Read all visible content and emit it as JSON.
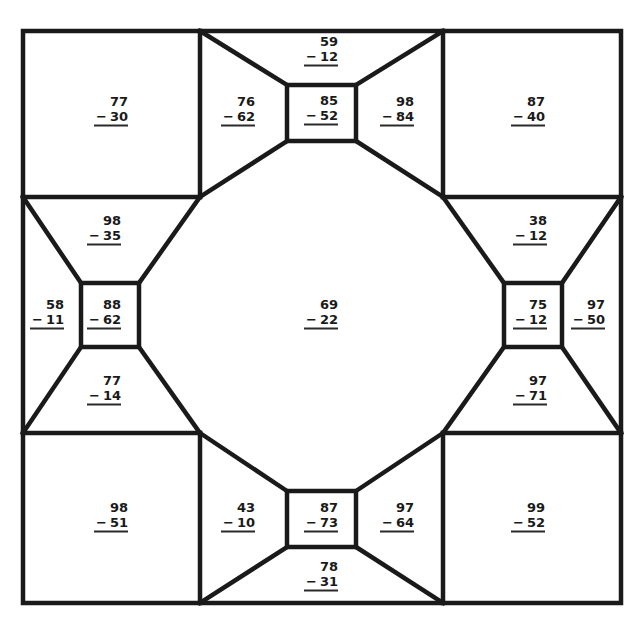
{
  "worksheet": {
    "type": "subtraction color-by-region puzzle",
    "operator": "−",
    "line_color": "#1a1a1a",
    "background_color": "#ffffff",
    "problems": [
      {
        "id": "corner-top-left",
        "minuend": "77",
        "subtrahend": "30",
        "x": 111,
        "y": 110
      },
      {
        "id": "top-left-trapezoid",
        "minuend": "76",
        "subtrahend": "62",
        "x": 238,
        "y": 110
      },
      {
        "id": "top-trapezoid",
        "minuend": "59",
        "subtrahend": "12",
        "x": 321,
        "y": 50
      },
      {
        "id": "top-center-box",
        "minuend": "85",
        "subtrahend": "52",
        "x": 321,
        "y": 109
      },
      {
        "id": "top-right-trapezoid",
        "minuend": "98",
        "subtrahend": "84",
        "x": 397,
        "y": 110
      },
      {
        "id": "corner-top-right",
        "minuend": "87",
        "subtrahend": "40",
        "x": 528,
        "y": 110
      },
      {
        "id": "left-top-trapezoid",
        "minuend": "98",
        "subtrahend": "35",
        "x": 104,
        "y": 229
      },
      {
        "id": "left-outer-trapezoid",
        "minuend": "58",
        "subtrahend": "11",
        "x": 47,
        "y": 313
      },
      {
        "id": "left-center-box",
        "minuend": "88",
        "subtrahend": "62",
        "x": 104,
        "y": 313
      },
      {
        "id": "left-bottom-trapezoid",
        "minuend": "77",
        "subtrahend": "14",
        "x": 104,
        "y": 389
      },
      {
        "id": "center-octagon",
        "minuend": "69",
        "subtrahend": "22",
        "x": 321,
        "y": 313
      },
      {
        "id": "right-top-trapezoid",
        "minuend": "38",
        "subtrahend": "12",
        "x": 530,
        "y": 229
      },
      {
        "id": "right-center-box",
        "minuend": "75",
        "subtrahend": "12",
        "x": 530,
        "y": 313
      },
      {
        "id": "right-outer-trapezoid",
        "minuend": "97",
        "subtrahend": "50",
        "x": 588,
        "y": 313
      },
      {
        "id": "right-bottom-trapezoid",
        "minuend": "97",
        "subtrahend": "71",
        "x": 530,
        "y": 389
      },
      {
        "id": "corner-bottom-left",
        "minuend": "98",
        "subtrahend": "51",
        "x": 111,
        "y": 516
      },
      {
        "id": "bottom-left-trapezoid",
        "minuend": "43",
        "subtrahend": "10",
        "x": 238,
        "y": 516
      },
      {
        "id": "bottom-center-box",
        "minuend": "87",
        "subtrahend": "73",
        "x": 321,
        "y": 516
      },
      {
        "id": "bottom-right-trapezoid",
        "minuend": "97",
        "subtrahend": "64",
        "x": 397,
        "y": 516
      },
      {
        "id": "bottom-trapezoid",
        "minuend": "78",
        "subtrahend": "31",
        "x": 321,
        "y": 575
      },
      {
        "id": "corner-bottom-right",
        "minuend": "99",
        "subtrahend": "52",
        "x": 528,
        "y": 516
      }
    ]
  }
}
